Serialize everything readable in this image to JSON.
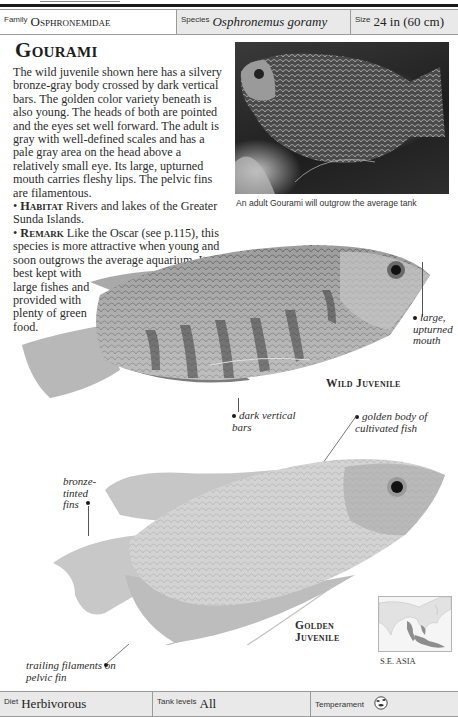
{
  "header": {
    "family_label": "Family",
    "family_value": "Osphronemidae",
    "species_label": "Species",
    "species_value": "Osphronemus goramy",
    "size_label": "Size",
    "size_value": "24 in (60 cm)"
  },
  "article": {
    "title": "Gourami",
    "description": "The wild juvenile shown here has a silvery bronze-gray body crossed by dark vertical bars. The golden color variety beneath is also young. The heads of both are pointed and the eyes set well forward. The adult is gray with well-defined scales and has a pale gray area on the head above a relatively small eye. Its large, upturned mouth carries fleshy lips. The pelvic fins are filamentous.",
    "habitat_label": "Habitat",
    "habitat_text": "Rivers and lakes of the Greater Sunda Islands.",
    "remark_label": "Remark",
    "remark_text_1": "Like the Oscar (see p.115), this species is more attractive when young and soon outgrows the average aquarium. It is best kept with",
    "remark_text_2": "large fishes and provided with plenty of green food."
  },
  "photo": {
    "caption": "An adult Gourami will outgrow the average tank"
  },
  "illustrations": {
    "wild_juvenile": {
      "label": "Wild Juvenile",
      "callouts": {
        "mouth": "large, upturned mouth",
        "bars": "dark vertical bars"
      }
    },
    "golden_juvenile": {
      "label_line1": "Golden",
      "label_line2": "Juvenile",
      "callouts": {
        "body": "golden body of cultivated fish",
        "fins": "bronze-tinted fins",
        "filaments": "trailing filaments on pelvic fin"
      }
    }
  },
  "map": {
    "region": "S.E. ASIA",
    "icon": "range-map-icon"
  },
  "footer": {
    "diet_label": "Diet",
    "diet_value": "Herbivorous",
    "tank_label": "Tank levels",
    "tank_value": "All",
    "temperament_label": "Temperament",
    "temperament_icon": "temperament-fish-icon"
  },
  "colors": {
    "bar_grey": "#e9e9e9",
    "rule": "#1a1a1a",
    "text": "#2b2b2b"
  }
}
